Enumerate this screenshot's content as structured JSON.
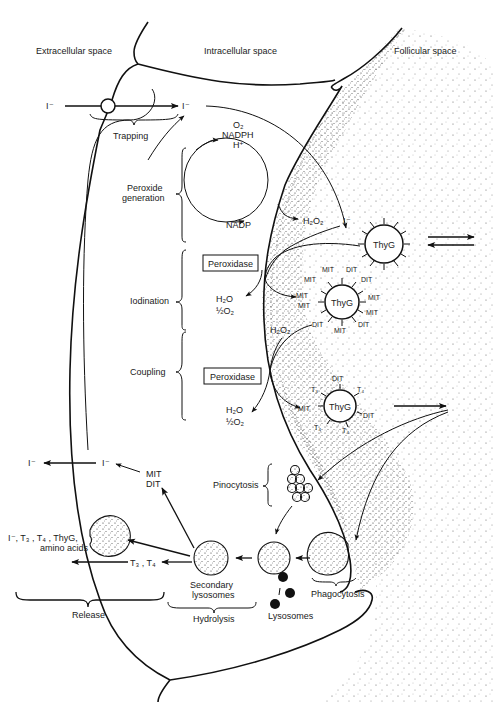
{
  "regions": {
    "extracellular": "Extracellular space",
    "intracellular": "Intracellular space",
    "follicular": "Follicular space"
  },
  "ions": {
    "iodide": "I⁻"
  },
  "stages": {
    "trapping": "Trapping",
    "peroxide_generation_1": "Peroxide",
    "peroxide_generation_2": "generation",
    "iodination": "Iodination",
    "coupling": "Coupling",
    "pinocytosis": "Pinocytosis",
    "phagocytosis": "Phagocytosis",
    "hydrolysis": "Hydrolysis",
    "release": "Release"
  },
  "cycle": {
    "o2": "O₂",
    "nadph": "NADPH",
    "hplus": "H⁺",
    "nadp": "NADP"
  },
  "species": {
    "h2o2": "H₂O₂",
    "h2o": "H₂O",
    "half_o2": "½O₂",
    "peroxidase": "Peroxidase",
    "thyg": "ThyG",
    "mit": "MIT",
    "dit": "DIT",
    "t3": "T₃",
    "t4": "T₄",
    "mit_dit_1": "MIT",
    "mit_dit_2": "DIT",
    "t3_t4": "T₃ , T₄",
    "release_mix_1": "I⁻, T₃ , T₄ , ThyG,",
    "release_mix_2": "amino acids",
    "secondary_lysosomes_1": "Secondary",
    "secondary_lysosomes_2": "lysosomes",
    "lysosomes": "Lysosomes"
  },
  "iodinated_thyg_labels": [
    "MIT",
    "DIT",
    "DIT",
    "MIT",
    "MIT",
    "DIT",
    "MIT",
    "MIT",
    "MIT",
    "DIT",
    "MIT"
  ],
  "coupled_thyg_labels": [
    "DIT",
    "T₃",
    "T₄",
    "MIT",
    "DIT",
    "T₄",
    "T₄"
  ]
}
